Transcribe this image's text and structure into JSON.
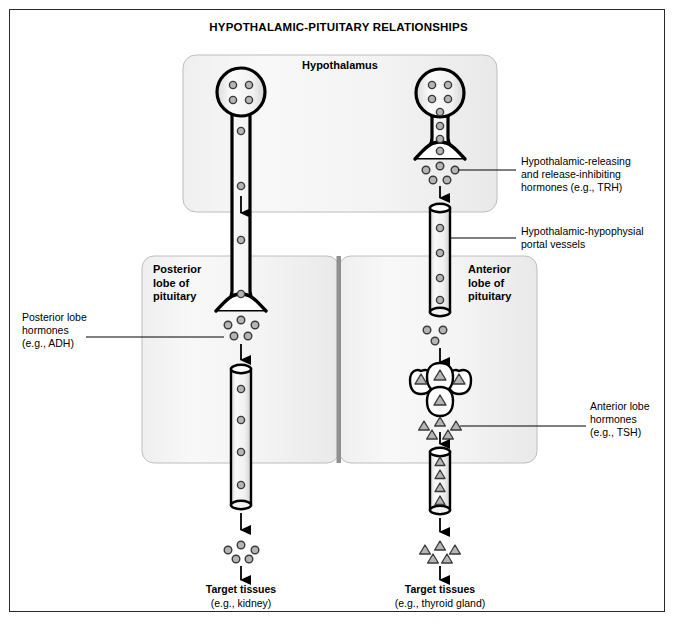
{
  "title": "HYPOTHALAMIC-PITUITARY RELATIONSHIPS",
  "regions": {
    "hypothalamus": "Hypothalamus",
    "posterior_lobe": "Posterior\nlobe of\npituitary",
    "posterior_lobe_lines": [
      "Posterior",
      "lobe of",
      "pituitary"
    ],
    "anterior_lobe": "Anterior\nlobe of\npituitary",
    "anterior_lobe_lines": [
      "Anterior",
      "lobe of",
      "pituitary"
    ]
  },
  "callouts": {
    "releasing_hormones": {
      "lines": [
        "Hypothalamic-releasing",
        "and release-inhibiting",
        "hormones (e.g., TRH)"
      ],
      "line1": "Hypothalamic-releasing",
      "line2": "and release-inhibiting",
      "line3": "hormones (e.g., TRH)"
    },
    "portal_vessels": {
      "lines": [
        "Hypothalamic-hypophysial",
        "portal vessels"
      ],
      "line1": "Hypothalamic-hypophysial",
      "line2": "portal vessels"
    },
    "posterior_hormones": {
      "lines": [
        "Posterior lobe",
        "hormones",
        "(e.g., ADH)"
      ],
      "line1": "Posterior lobe",
      "line2": "hormones",
      "line3": "(e.g., ADH)"
    },
    "anterior_hormones": {
      "lines": [
        "Anterior lobe",
        "hormones",
        "(e.g., TSH)"
      ],
      "line1": "Anterior lobe",
      "line2": "hormones",
      "line3": "(e.g., TSH)"
    }
  },
  "targets": {
    "left": {
      "title": "Target tissues",
      "detail": "(e.g., kidney)"
    },
    "right": {
      "title": "Target tissues",
      "detail": "(e.g., thyroid gland)"
    }
  },
  "colors": {
    "outline": "#000000",
    "frame": "#2a2a2a",
    "box_fill_light": "#f7f7f7",
    "box_fill_shade": "#ebebeb",
    "box_stroke": "#b8b8b8",
    "divider": "#8a8a8a",
    "granule_fill": "#b8b8b8",
    "granule_stroke": "#333333",
    "vessel_fill": "#f2f2f2",
    "background": "#ffffff"
  },
  "icons": {
    "neuron_cell_body": "neuron-soma-icon",
    "axon": "axon-icon",
    "vesicle": "vesicle-circle-icon",
    "hormone_triangle": "hormone-triangle-icon",
    "vessel": "blood-vessel-cylinder-icon",
    "arrow": "down-arrow-icon",
    "secretory_cells": "secretory-cell-cluster-icon"
  },
  "counts": {
    "left_soma_vesicles": 4,
    "right_soma_vesicles": 6,
    "left_axon_vesicles": 4,
    "right_axon_vesicles": 4,
    "releasing_granules": 5,
    "portal_vessel_vesicles": 4,
    "posterior_release_granules": 5,
    "posterior_vessel_vesicles": 4,
    "anterior_transfer_granules": 3,
    "secretory_cells": 4,
    "anterior_release_triangles": 5,
    "anterior_vessel_triangles": 4,
    "left_target_granules": 5,
    "right_target_triangles": 5
  }
}
